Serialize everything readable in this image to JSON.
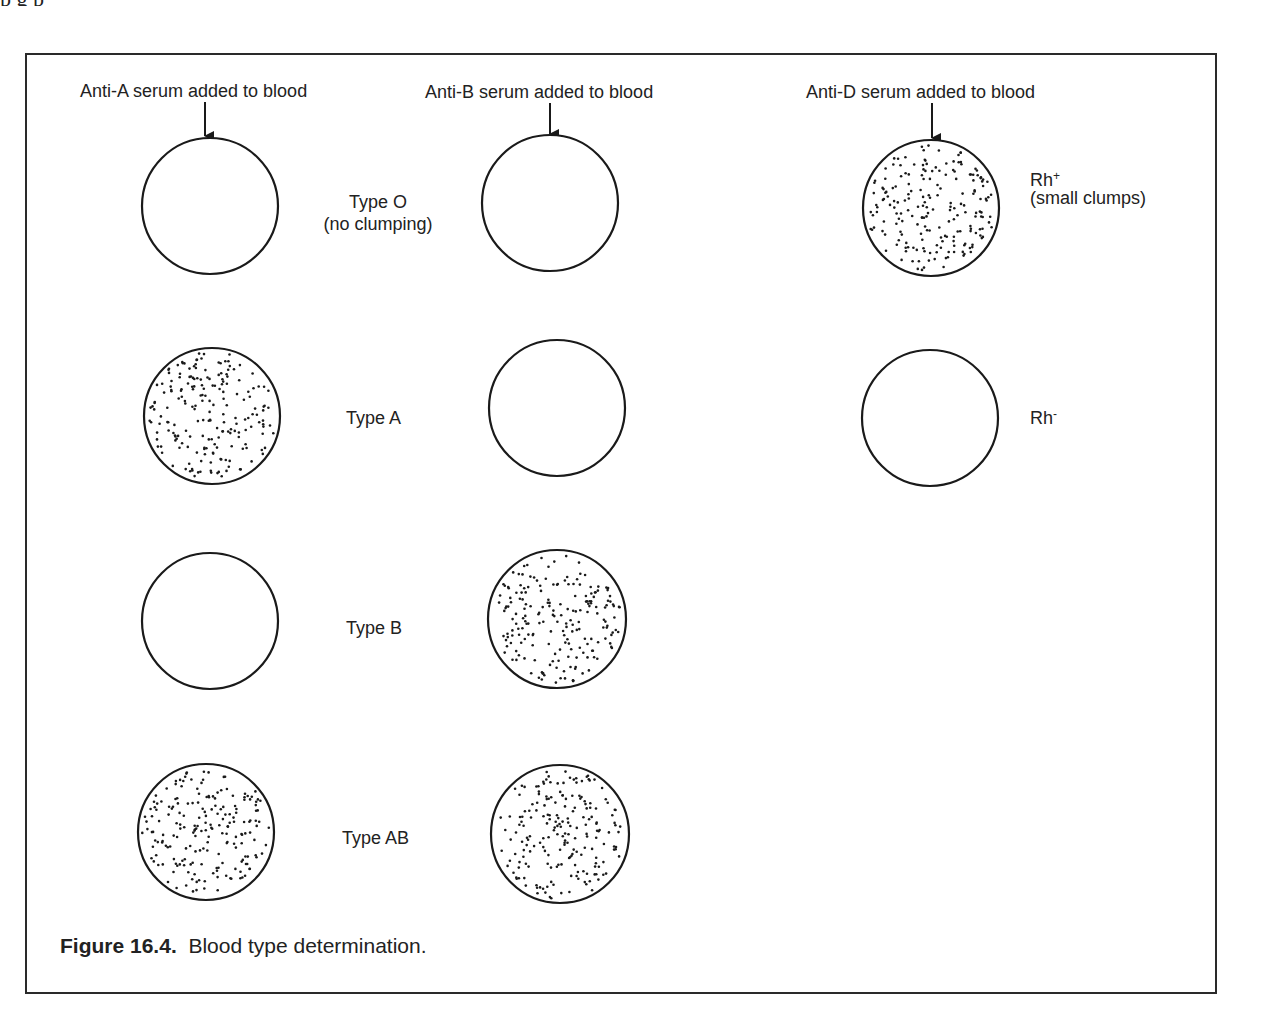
{
  "page": {
    "top_cutoff_text": "              p                                       g         p"
  },
  "columns": [
    {
      "id": "anti-a",
      "header": "Anti-A serum added to blood"
    },
    {
      "id": "anti-b",
      "header": "Anti-B serum added to blood"
    },
    {
      "id": "anti-d",
      "header": "Anti-D serum added to blood"
    }
  ],
  "rows": [
    {
      "label": "Type O",
      "sublabel": "(no clumping)",
      "anti_a": "no clumping",
      "anti_b": "no clumping"
    },
    {
      "label": "Type A",
      "sublabel": "",
      "anti_a": "clumping",
      "anti_b": "no clumping"
    },
    {
      "label": "Type B",
      "sublabel": "",
      "anti_a": "no clumping",
      "anti_b": "clumping"
    },
    {
      "label": "Type AB",
      "sublabel": "",
      "anti_a": "clumping",
      "anti_b": "clumping"
    }
  ],
  "rh": [
    {
      "label": "Rh",
      "superscript": "+",
      "sublabel": "(small clumps)",
      "result": "clumping"
    },
    {
      "label": "Rh",
      "superscript": "-",
      "sublabel": "",
      "result": "no clumping"
    }
  ],
  "caption": {
    "number": "Figure 16.4.",
    "text": "Blood type determination."
  },
  "colors": {
    "stroke": "#1a1a1a",
    "background": "#ffffff"
  }
}
